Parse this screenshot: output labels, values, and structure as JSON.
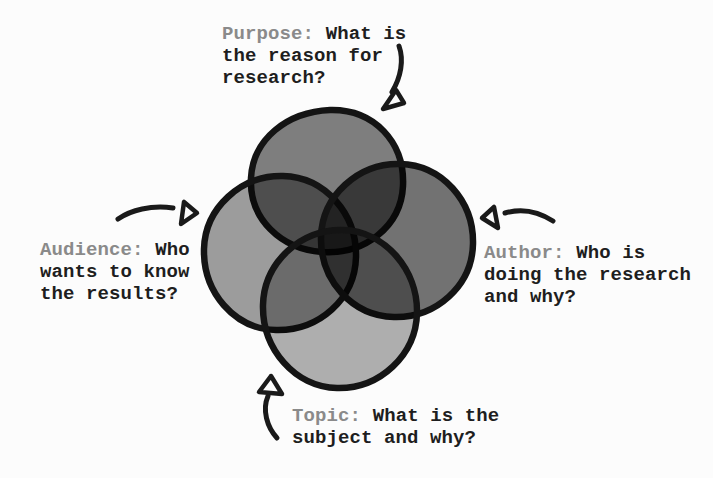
{
  "venn": {
    "circles": [
      {
        "name": "purpose",
        "position": "top",
        "color": "#7f7f7f",
        "fill": "rgba(0,0,0,0.50)"
      },
      {
        "name": "audience",
        "position": "left",
        "color": "#9d9d9d",
        "fill": "rgba(0,0,0,0.38)"
      },
      {
        "name": "author",
        "position": "right",
        "color": "#707070",
        "fill": "rgba(0,0,0,0.55)"
      },
      {
        "name": "topic",
        "position": "bottom",
        "color": "#b0b0b0",
        "fill": "rgba(0,0,0,0.31)"
      }
    ],
    "stroke_color": "#141414"
  },
  "labels": {
    "purpose": {
      "term": "Purpose:",
      "lines": [
        "What is",
        "the reason for",
        "research?"
      ]
    },
    "audience": {
      "term": "Audience:",
      "lines": [
        "Who",
        "wants to know",
        "the results?"
      ]
    },
    "author": {
      "term": "Author:",
      "lines": [
        "Who is",
        "doing the research",
        "and why?"
      ]
    },
    "topic": {
      "term": "Topic:",
      "lines": [
        "What is the",
        "subject and why?"
      ]
    }
  },
  "colors": {
    "term_gray": "#8a8a8a",
    "text_black": "#1e1e1e",
    "background": "#fcfcfc",
    "arrow_black": "#1a1a1a"
  }
}
